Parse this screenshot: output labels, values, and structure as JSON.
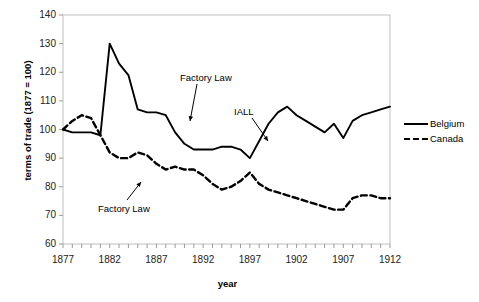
{
  "chart_data": {
    "type": "line",
    "title": "",
    "xlabel": "year",
    "ylabel": "terms of trade (1877 = 100)",
    "xlim": [
      1877,
      1912
    ],
    "ylim": [
      60,
      140
    ],
    "ytick_step": 10,
    "xtick_step": 5,
    "grid": false,
    "legend_position": "right",
    "x": [
      1877,
      1878,
      1879,
      1880,
      1881,
      1882,
      1883,
      1884,
      1885,
      1886,
      1887,
      1888,
      1889,
      1890,
      1891,
      1892,
      1893,
      1894,
      1895,
      1896,
      1897,
      1898,
      1899,
      1900,
      1901,
      1902,
      1903,
      1904,
      1905,
      1906,
      1907,
      1908,
      1909,
      1910,
      1911,
      1912
    ],
    "yticks": [
      60,
      70,
      80,
      90,
      100,
      110,
      120,
      130,
      140
    ],
    "xticks": [
      1877,
      1882,
      1887,
      1892,
      1897,
      1902,
      1907,
      1912
    ],
    "series": [
      {
        "name": "Belgium",
        "style": "solid",
        "color": "#000000",
        "values": [
          100,
          99,
          99,
          99,
          98,
          130,
          123,
          119,
          107,
          106,
          106,
          105,
          99,
          95,
          93,
          93,
          93,
          94,
          94,
          93,
          90,
          96,
          102,
          106,
          108,
          105,
          103,
          101,
          99,
          102,
          97,
          103,
          105,
          106,
          107,
          108
        ]
      },
      {
        "name": "Canada",
        "style": "dashed",
        "color": "#000000",
        "values": [
          100,
          103,
          105,
          104,
          98,
          92,
          90,
          90,
          92,
          91,
          88,
          86,
          87,
          86,
          86,
          84,
          81,
          79,
          80,
          82,
          85,
          81,
          79,
          78,
          77,
          76,
          75,
          74,
          73,
          72,
          72,
          76,
          77,
          77,
          76,
          76
        ]
      }
    ],
    "annotations": [
      {
        "text": "Factory Law",
        "target_series": "Belgium",
        "target_year": 1889,
        "target_value": 99
      },
      {
        "text": "IALL",
        "target_series": "Belgium",
        "target_year": 1897,
        "target_value": 90
      },
      {
        "text": "Factory Law",
        "target_series": "Canada",
        "target_year": 1889,
        "target_value": 87
      }
    ]
  },
  "axes": {
    "ytick_labels": [
      "140",
      "130",
      "120",
      "110",
      "100",
      "90",
      "80",
      "70",
      "60"
    ],
    "xtick_labels": [
      "1877",
      "1882",
      "1887",
      "1892",
      "1897",
      "1902",
      "1907",
      "1912"
    ],
    "y_title": "terms of trade (1877 = 100)",
    "x_title": "year"
  },
  "annotations": {
    "factory_law_belgium": "Factory Law",
    "iall_belgium": "IALL",
    "factory_law_canada": "Factory Law"
  },
  "legend": {
    "items": [
      {
        "label": "Belgium",
        "style": "solid"
      },
      {
        "label": "Canada",
        "style": "dashed"
      }
    ]
  }
}
